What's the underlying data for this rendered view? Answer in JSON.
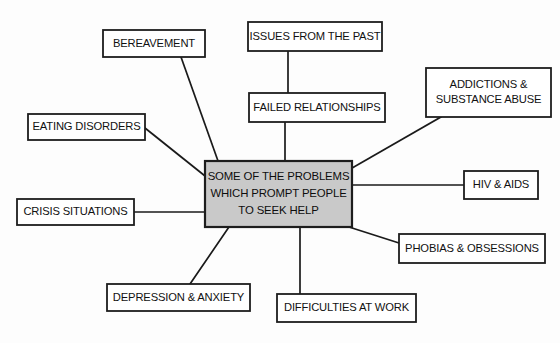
{
  "diagram": {
    "type": "spider-mind-map",
    "title_text": "SOME OF THE PROBLEMS WHICH PROMPT PEOPLE TO SEEK HELP",
    "background_color": "#fdfdfd",
    "line_color": "#1a1a1a",
    "center_fill_color": "#c9c9c9",
    "node_fill_color": "#ffffff",
    "center": {
      "line1": "SOME OF THE PROBLEMS",
      "line2": "WHICH PROMPT PEOPLE",
      "line3": "TO SEEK HELP",
      "x": 205,
      "y": 161,
      "w": 147,
      "h": 66
    },
    "nodes": [
      {
        "id": "bereavement",
        "line1": "BEREAVEMENT",
        "line2": "",
        "x": 103,
        "y": 30,
        "w": 102,
        "h": 27,
        "connector": {
          "x1": 181,
          "y1": 57,
          "x2": 218,
          "y2": 161
        }
      },
      {
        "id": "issues-from-the-past",
        "line1": "ISSUES FROM THE PAST",
        "line2": "",
        "x": 248,
        "y": 22,
        "w": 134,
        "h": 29,
        "connector": {
          "x1": 288,
          "y1": 51,
          "x2": 288,
          "y2": 93
        }
      },
      {
        "id": "failed-relationships",
        "line1": "FAILED RELATIONSHIPS",
        "line2": "",
        "x": 249,
        "y": 93,
        "w": 136,
        "h": 29,
        "connector": {
          "x1": 285,
          "y1": 122,
          "x2": 285,
          "y2": 161
        }
      },
      {
        "id": "addictions-substance-abuse",
        "line1": "ADDICTIONS &",
        "line2": "SUBSTANCE ABUSE",
        "x": 426,
        "y": 68,
        "w": 125,
        "h": 49,
        "connector": {
          "x1": 441,
          "y1": 117,
          "x2": 352,
          "y2": 168
        }
      },
      {
        "id": "eating-disorders",
        "line1": "EATING DISORDERS",
        "line2": "",
        "x": 28,
        "y": 114,
        "w": 117,
        "h": 26,
        "connector": {
          "x1": 145,
          "y1": 128,
          "x2": 205,
          "y2": 176
        }
      },
      {
        "id": "hiv-aids",
        "line1": "HIV & AIDS",
        "line2": "",
        "x": 464,
        "y": 171,
        "w": 74,
        "h": 28,
        "connector": {
          "x1": 464,
          "y1": 185,
          "x2": 352,
          "y2": 185
        }
      },
      {
        "id": "crisis-situations",
        "line1": "CRISIS SITUATIONS",
        "line2": "",
        "x": 17,
        "y": 199,
        "w": 117,
        "h": 26,
        "connector": {
          "x1": 134,
          "y1": 212,
          "x2": 205,
          "y2": 212
        }
      },
      {
        "id": "phobias-obsessions",
        "line1": "PHOBIAS & OBSESSIONS",
        "line2": "",
        "x": 399,
        "y": 234,
        "w": 146,
        "h": 29,
        "connector": {
          "x1": 399,
          "y1": 243,
          "x2": 349,
          "y2": 227
        }
      },
      {
        "id": "depression-anxiety",
        "line1": "DEPRESSION & ANXIETY",
        "line2": "",
        "x": 107,
        "y": 284,
        "w": 143,
        "h": 27,
        "connector": {
          "x1": 190,
          "y1": 284,
          "x2": 229,
          "y2": 227
        }
      },
      {
        "id": "difficulties-at-work",
        "line1": "DIFFICULTIES AT WORK",
        "line2": "",
        "x": 277,
        "y": 294,
        "w": 139,
        "h": 28,
        "connector": {
          "x1": 300,
          "y1": 294,
          "x2": 300,
          "y2": 227
        }
      }
    ]
  }
}
